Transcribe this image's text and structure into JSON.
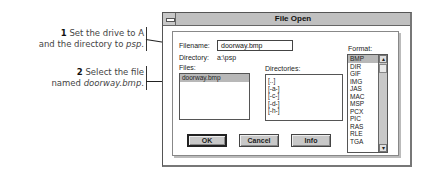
{
  "callouts": [
    {
      "step": "1",
      "line1": "Set the drive to A",
      "line2_prefix": "and the directory to ",
      "line2_em": "psp",
      "line2_suffix": "."
    },
    {
      "step": "2",
      "line1": "Select the file",
      "line2_prefix": "named ",
      "line2_em": "doorway.bmp",
      "line2_suffix": "."
    }
  ],
  "dialog": {
    "title": "File Open",
    "filename_label": "Filename:",
    "filename_value": "doorway.bmp",
    "directory_label": "Directory:",
    "directory_value": "a:\\psp",
    "files_label": "Files:",
    "files": [
      {
        "name": "doorway.bmp",
        "selected": true
      }
    ],
    "directories_label": "Directories:",
    "directories": [
      "[..]",
      "[-a-]",
      "[-c-]",
      "[-d-]",
      "[-h-]"
    ],
    "format_label": "Format:",
    "formats": [
      "BMP",
      "DIR",
      "GIF",
      "IMG",
      "JAS",
      "MAC",
      "MSP",
      "PCX",
      "PIC",
      "RAS",
      "RLE",
      "TGA"
    ],
    "selected_format": "BMP",
    "buttons": {
      "ok": "OK",
      "cancel": "Cancel",
      "info": "Info"
    }
  }
}
